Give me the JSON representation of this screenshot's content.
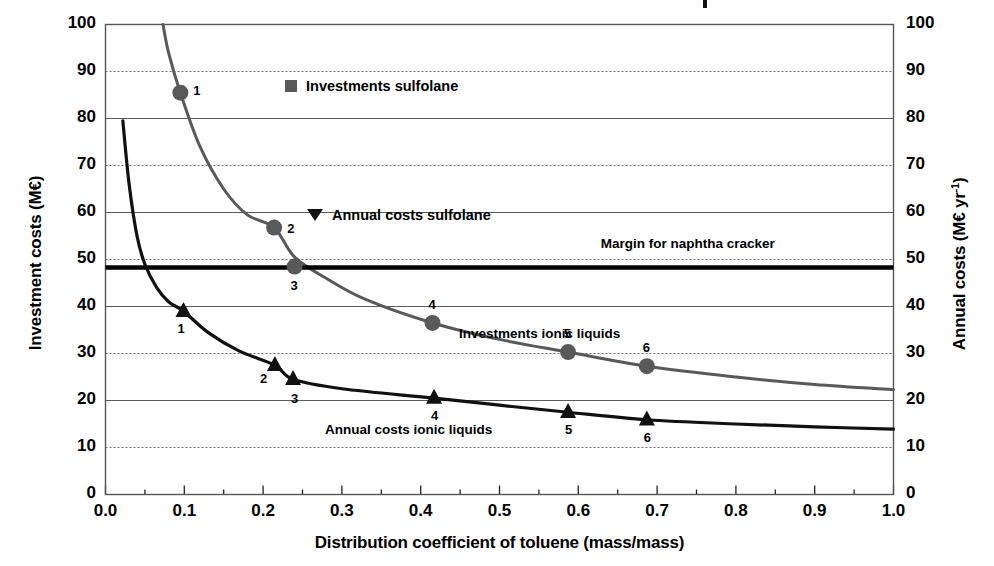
{
  "chart_data": {
    "type": "line",
    "title": "",
    "xlabel": "Distribution coefficient of toluene (mass/mass)",
    "ylabel_left": "Investment costs (M€)",
    "ylabel_right": "Annual costs (M€ yr⁻¹)",
    "xlim": [
      0.0,
      1.0
    ],
    "ylim_left": [
      0,
      100
    ],
    "ylim_right": [
      0,
      100
    ],
    "grid": true,
    "legend_position": "inside-upper-center",
    "x_ticks": [
      "0.0",
      "0.1",
      "0.2",
      "0.3",
      "0.4",
      "0.5",
      "0.6",
      "0.7",
      "0.8",
      "0.9",
      "1.0"
    ],
    "x_tick_values": [
      0.0,
      0.1,
      0.2,
      0.3,
      0.4,
      0.5,
      0.6,
      0.7,
      0.8,
      0.9,
      1.0
    ],
    "x_minor_tick_step": 0.05,
    "y_ticks_left": [
      "0",
      "10",
      "20",
      "30",
      "40",
      "50",
      "60",
      "70",
      "80",
      "90",
      "100"
    ],
    "y_ticks_right": [
      "0",
      "10",
      "20",
      "30",
      "40",
      "50",
      "60",
      "70",
      "80",
      "90",
      "100"
    ],
    "y_tick_values": [
      0,
      10,
      20,
      30,
      40,
      50,
      60,
      70,
      80,
      90,
      100
    ],
    "series": [
      {
        "name": "Investments ionic liquids",
        "marker": "circle",
        "color": "#595959",
        "curve": [
          {
            "x": 0.073,
            "y": 100.0
          },
          {
            "x": 0.08,
            "y": 94.0
          },
          {
            "x": 0.095,
            "y": 85.5
          },
          {
            "x": 0.12,
            "y": 74.0
          },
          {
            "x": 0.15,
            "y": 65.0
          },
          {
            "x": 0.18,
            "y": 59.5
          },
          {
            "x": 0.214,
            "y": 56.8
          },
          {
            "x": 0.24,
            "y": 50.5
          },
          {
            "x": 0.28,
            "y": 46.0
          },
          {
            "x": 0.33,
            "y": 41.5
          },
          {
            "x": 0.415,
            "y": 36.5
          },
          {
            "x": 0.5,
            "y": 33.0
          },
          {
            "x": 0.587,
            "y": 30.3
          },
          {
            "x": 0.687,
            "y": 27.3
          },
          {
            "x": 0.8,
            "y": 25.0
          },
          {
            "x": 0.9,
            "y": 23.4
          },
          {
            "x": 1.0,
            "y": 22.3
          }
        ],
        "points": [
          {
            "label": "1",
            "x": 0.095,
            "y": 85.5
          },
          {
            "label": "2",
            "x": 0.214,
            "y": 56.8
          },
          {
            "label": "3",
            "x": 0.24,
            "y": 48.5
          },
          {
            "label": "4",
            "x": 0.415,
            "y": 36.5
          },
          {
            "label": "5",
            "x": 0.587,
            "y": 30.3
          },
          {
            "label": "6",
            "x": 0.687,
            "y": 27.3
          }
        ]
      },
      {
        "name": "Annual costs ionic liquids",
        "marker": "triangle",
        "color": "#111111",
        "curve": [
          {
            "x": 0.022,
            "y": 79.5
          },
          {
            "x": 0.03,
            "y": 66.0
          },
          {
            "x": 0.04,
            "y": 55.0
          },
          {
            "x": 0.05,
            "y": 49.0
          },
          {
            "x": 0.065,
            "y": 44.0
          },
          {
            "x": 0.08,
            "y": 41.0
          },
          {
            "x": 0.099,
            "y": 39.0
          },
          {
            "x": 0.13,
            "y": 34.5
          },
          {
            "x": 0.17,
            "y": 30.5
          },
          {
            "x": 0.215,
            "y": 27.5
          },
          {
            "x": 0.238,
            "y": 24.5
          },
          {
            "x": 0.3,
            "y": 22.5
          },
          {
            "x": 0.417,
            "y": 20.5
          },
          {
            "x": 0.5,
            "y": 19.0
          },
          {
            "x": 0.587,
            "y": 17.5
          },
          {
            "x": 0.687,
            "y": 15.9
          },
          {
            "x": 0.8,
            "y": 15.0
          },
          {
            "x": 0.9,
            "y": 14.4
          },
          {
            "x": 1.0,
            "y": 13.9
          }
        ],
        "points": [
          {
            "label": "1",
            "x": 0.099,
            "y": 39.0
          },
          {
            "label": "2",
            "x": 0.215,
            "y": 27.5
          },
          {
            "label": "3",
            "x": 0.238,
            "y": 24.5
          },
          {
            "label": "4",
            "x": 0.417,
            "y": 20.5
          },
          {
            "label": "5",
            "x": 0.587,
            "y": 17.5
          },
          {
            "label": "6",
            "x": 0.687,
            "y": 15.9
          }
        ]
      }
    ],
    "reference_line": {
      "label": "Margin for naphtha cracker",
      "y": 48.3,
      "color": "#000000"
    },
    "legend": [
      {
        "label": "Investments sulfolane",
        "marker": "square",
        "color": "#595959"
      },
      {
        "label": "Annual costs sulfolane",
        "marker": "triangle-down",
        "color": "#111111"
      }
    ],
    "inline_labels": [
      {
        "text": "Investments ionic liquids",
        "x": 0.55,
        "y": 34.0
      },
      {
        "text": "Annual costs ionic liquids",
        "x": 0.38,
        "y": 13.5
      },
      {
        "text": "Margin for naphtha cracker",
        "x": 0.73,
        "y": 53.0
      }
    ]
  },
  "axes": {
    "x_title": "Distribution coefficient of toluene (mass/mass)",
    "y_left_title": "Investment costs (M€)",
    "y_right_title": "Annual costs (M€ yr⁻¹)"
  }
}
